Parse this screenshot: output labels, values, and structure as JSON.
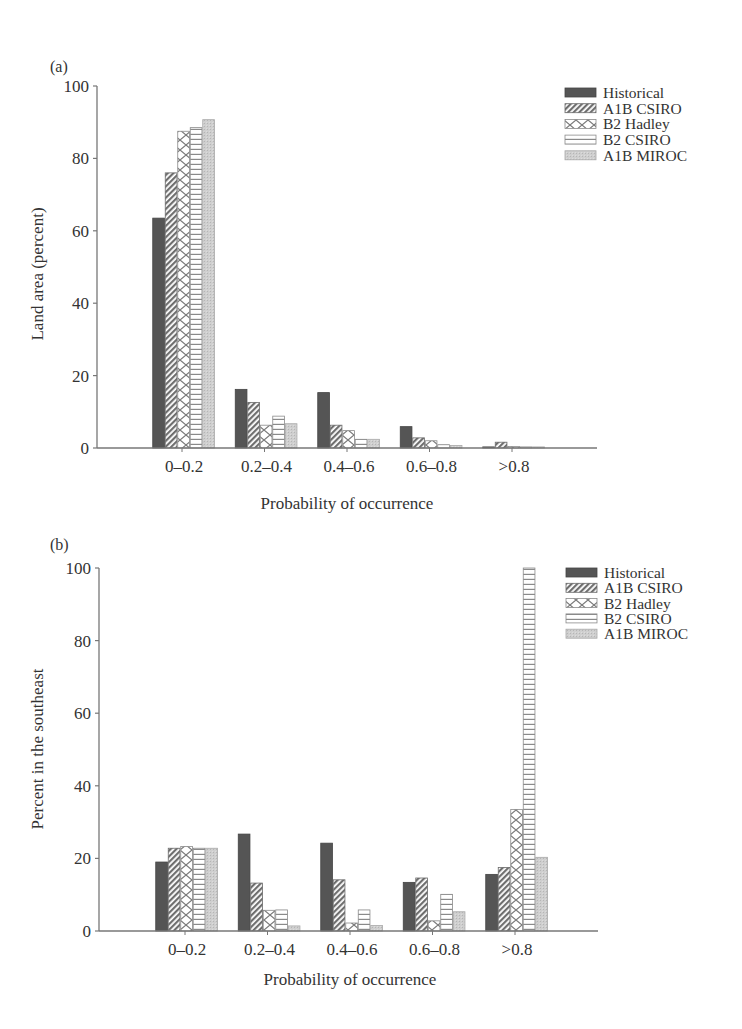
{
  "chart_data": [
    {
      "panel_label": "(a)",
      "type": "bar",
      "title": "",
      "xlabel": "Probability of occurrence",
      "ylabel": "Land area (percent)",
      "ylim": [
        0,
        100
      ],
      "yticks": [
        0,
        20,
        40,
        60,
        80,
        100
      ],
      "grid": false,
      "legend_position": "upper right",
      "categories": [
        "0–0.2",
        "0.2–0.4",
        "0.4–0.6",
        "0.6–0.8",
        ">0.8"
      ],
      "series": [
        {
          "name": "Historical",
          "values": [
            63.5,
            16.2,
            15.3,
            5.9,
            0.3
          ]
        },
        {
          "name": "A1B CSIRO",
          "values": [
            76,
            12.6,
            6.3,
            2.8,
            1.6
          ]
        },
        {
          "name": "B2 Hadley",
          "values": [
            87.5,
            6.3,
            4.8,
            2.0,
            0.4
          ]
        },
        {
          "name": "B2 CSIRO",
          "values": [
            88.5,
            8.8,
            2.4,
            0.9,
            0.3
          ]
        },
        {
          "name": "A1B MIROC",
          "values": [
            90.7,
            6.7,
            2.4,
            0.7,
            0.3
          ]
        }
      ]
    },
    {
      "panel_label": "(b)",
      "type": "bar",
      "title": "",
      "xlabel": "Probability of occurrence",
      "ylabel": "Percent in the southeast",
      "ylim": [
        0,
        100
      ],
      "yticks": [
        0,
        20,
        40,
        60,
        80,
        100
      ],
      "grid": false,
      "legend_position": "upper right",
      "categories": [
        "0–0.2",
        "0.2–0.4",
        "0.4–0.6",
        "0.6–0.8",
        ">0.8"
      ],
      "series": [
        {
          "name": "Historical",
          "values": [
            19,
            26.7,
            24.2,
            13.4,
            15.6
          ]
        },
        {
          "name": "A1B CSIRO",
          "values": [
            22.8,
            13.2,
            14.1,
            14.6,
            17.5
          ]
        },
        {
          "name": "B2 Hadley",
          "values": [
            23.3,
            5.7,
            2.2,
            2.8,
            33.5
          ]
        },
        {
          "name": "B2 CSIRO",
          "values": [
            22.8,
            5.8,
            5.8,
            10.1,
            100
          ]
        },
        {
          "name": "A1B MIROC",
          "values": [
            22.8,
            1.4,
            1.5,
            5.3,
            20.3
          ]
        }
      ]
    }
  ],
  "series_styles": [
    {
      "name": "Historical",
      "pattern": "solid-dark",
      "color": "#505050"
    },
    {
      "name": "A1B CSIRO",
      "pattern": "diagonal-hatch",
      "color": "#777777"
    },
    {
      "name": "B2 Hadley",
      "pattern": "crosshatch",
      "color": "#8a8a8a"
    },
    {
      "name": "B2 CSIRO",
      "pattern": "horizontal-lines",
      "color": "#8a8a8a"
    },
    {
      "name": "A1B MIROC",
      "pattern": "light-stipple",
      "color": "#c8c8c8"
    }
  ]
}
